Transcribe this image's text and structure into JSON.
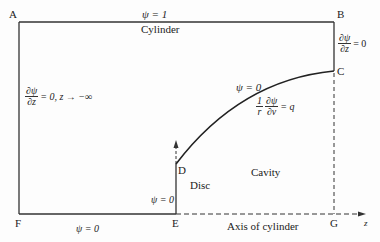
{
  "diagram": {
    "points": {
      "A": "A",
      "B": "B",
      "C": "C",
      "D": "D",
      "E": "E",
      "F": "F",
      "G": "G"
    },
    "labels": {
      "top_condition": "ψ = 1",
      "cylinder": "Cylinder",
      "left_condition_num": "∂ψ",
      "left_condition_den": "∂z",
      "left_condition_rest": "= 0, z → −∞",
      "right_condition_num": "∂ψ",
      "right_condition_den": "∂z",
      "right_condition_rest": "= 0",
      "curve_condition": "ψ = 0",
      "curve_flux_coef_num": "1",
      "curve_flux_coef_den": "r",
      "curve_flux_num": "∂ψ",
      "curve_flux_den": "∂ν",
      "curve_flux_rest": "= q",
      "disc_condition": "ψ = 0",
      "disc": "Disc",
      "cavity": "Cavity",
      "bottom_condition": "ψ = 0",
      "axis": "Axis of cylinder",
      "z_axis": "z"
    },
    "colors": {
      "line": "#333333",
      "background": "#fdfdfd"
    }
  }
}
